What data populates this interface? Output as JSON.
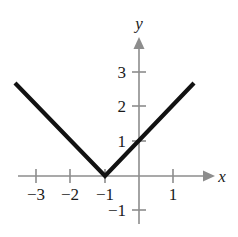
{
  "figure": {
    "background_color": "#ffffff",
    "axis_color": "#8d8d8d",
    "curve_color": "#121212",
    "label_color": "#1a1a1a"
  },
  "axes": {
    "x_axis_label": "x",
    "y_axis_label": "y",
    "x_ticks": [
      {
        "value": -3,
        "label": "−3",
        "px": 36
      },
      {
        "value": -2,
        "label": "−2",
        "px": 70
      },
      {
        "value": -1,
        "label": "−1",
        "px": 105
      },
      {
        "value": 1,
        "label": "1",
        "px": 173
      }
    ],
    "y_ticks": [
      {
        "value": 3,
        "label": "3",
        "py": 72
      },
      {
        "value": 2,
        "label": "2",
        "py": 106
      },
      {
        "value": 1,
        "label": "1",
        "py": 141
      },
      {
        "value": -1,
        "label": "−1",
        "py": 210
      }
    ]
  },
  "chart_data": {
    "type": "line",
    "title": "",
    "xlabel": "x",
    "ylabel": "y",
    "xlim": [
      -3.6,
      1.95
    ],
    "ylim": [
      -1.8,
      3.5
    ],
    "grid": false,
    "legend": null,
    "origin_px": {
      "x": 139,
      "y": 176
    },
    "px_per_unit": {
      "x": 34.3,
      "y": 34.6
    },
    "annotations": [],
    "series": [
      {
        "name": "y = |x + 1|",
        "equation": "y = |x + 1|",
        "vertex": {
          "x": -1,
          "y": 0
        },
        "x": [
          -3.6,
          -1,
          1.6
        ],
        "y": [
          2.6,
          0,
          2.6
        ],
        "points_px": [
          {
            "x": 15,
            "y": 83
          },
          {
            "x": 105,
            "y": 176
          },
          {
            "x": 194,
            "y": 83
          }
        ]
      }
    ]
  }
}
